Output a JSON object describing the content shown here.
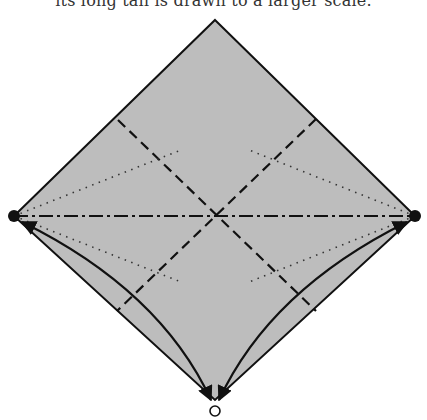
{
  "caption": {
    "text": "its long tail is drawn to a larger scale."
  },
  "diagram": {
    "type": "penrose-diagram",
    "fill_color": "#bdbdbd",
    "stroke_color": "#111111",
    "vertices": {
      "top": [
        215,
        20
      ],
      "right": [
        415,
        216
      ],
      "bottom": [
        215,
        400
      ],
      "left": [
        14,
        216
      ]
    },
    "markers": [
      {
        "name": "left-point",
        "style": "filled",
        "at": [
          14,
          216
        ]
      },
      {
        "name": "right-point",
        "style": "filled",
        "at": [
          415,
          216
        ]
      },
      {
        "name": "bottom-point",
        "style": "open",
        "at": [
          215,
          411
        ]
      }
    ],
    "horizontal_axis": {
      "style": "dash-dot",
      "from": [
        14,
        216
      ],
      "to": [
        415,
        216
      ]
    },
    "dashed_lines": [
      {
        "from": [
          118,
          120
        ],
        "to": [
          316,
          311
        ]
      },
      {
        "from": [
          316,
          119
        ],
        "to": [
          117,
          311
        ]
      }
    ],
    "dotted_lines": [
      {
        "from": [
          14,
          216
        ],
        "to": [
          181,
          150
        ]
      },
      {
        "from": [
          14,
          216
        ],
        "to": [
          181,
          282
        ]
      },
      {
        "from": [
          415,
          216
        ],
        "to": [
          249,
          150
        ]
      },
      {
        "from": [
          415,
          216
        ],
        "to": [
          249,
          282
        ]
      }
    ],
    "curves": [
      {
        "name": "left-curve",
        "from": [
          14,
          216
        ],
        "to": [
          211,
          402
        ]
      },
      {
        "name": "right-curve",
        "from": [
          415,
          216
        ],
        "to": [
          219,
          402
        ]
      }
    ]
  }
}
